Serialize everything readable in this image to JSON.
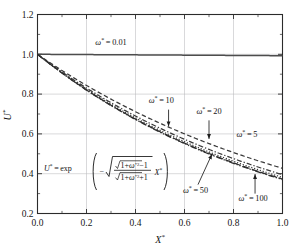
{
  "chart_data": {
    "type": "line",
    "title": "",
    "subtitle": "",
    "xlabel": "X*",
    "ylabel": "U*",
    "xlim": [
      0.0,
      1.0
    ],
    "ylim": [
      0.2,
      1.2
    ],
    "xticks": [
      "0.0",
      "0.2",
      "0.4",
      "0.6",
      "0.8",
      "1.0"
    ],
    "xtick_values": [
      0.0,
      0.2,
      0.4,
      0.6,
      0.8,
      1.0
    ],
    "yticks": [
      "0.2",
      "0.4",
      "0.6",
      "0.8",
      "1.0",
      "1.2"
    ],
    "ytick_values": [
      0.2,
      0.4,
      0.6,
      0.8,
      1.0,
      1.2
    ],
    "grid": true,
    "grid_axes": "both",
    "legend_position": "inline-annotations",
    "minor_ticks": true,
    "equation_annotation": "U* = exp( - sqrt( ( sqrt(1+w*^2) - 1 ) / ( sqrt(1+w*^2) + 1 ) ) X* )",
    "equation_parts": {
      "lhs": "U",
      "lhs_star": "*",
      "eq": "=",
      "exp": "exp",
      "minus": "−",
      "num_radical": "1+ω",
      "num_sup": "*2",
      "num_tail": "−1",
      "den_radical": "1+ω",
      "den_sup": "*2",
      "den_tail": "+1",
      "var": "X",
      "var_star": "*"
    },
    "series": [
      {
        "name": "ω* = 0.01",
        "omega": 0.01,
        "decay_k": 0.00707,
        "style": "solid",
        "color": "#4d4d4d",
        "label_text": "ω*=0.01",
        "label_x": 0.3,
        "label_y": 1.045,
        "has_arrow": false,
        "x": [
          0.0,
          0.1,
          0.2,
          0.3,
          0.4,
          0.5,
          0.6,
          0.7,
          0.8,
          0.9,
          1.0
        ],
        "y": [
          1.0,
          0.999,
          0.999,
          0.998,
          0.997,
          0.996,
          0.996,
          0.995,
          0.994,
          0.994,
          0.993
        ]
      },
      {
        "name": "ω* = 5",
        "omega": 5,
        "decay_k": 0.8507,
        "style": "dashed",
        "color": "#3a3a3a",
        "label_text": "ω*=5",
        "label_x": 0.855,
        "label_y": 0.585,
        "has_arrow": false,
        "x": [
          0.0,
          0.1,
          0.2,
          0.3,
          0.4,
          0.5,
          0.6,
          0.7,
          0.8,
          0.9,
          1.0
        ],
        "y": [
          1.0,
          0.918,
          0.843,
          0.775,
          0.711,
          0.653,
          0.6,
          0.551,
          0.506,
          0.465,
          0.427
        ]
      },
      {
        "name": "ω* = 10",
        "omega": 10,
        "decay_k": 0.9285,
        "style": "dash-dot",
        "color": "#3a3a3a",
        "label_text": "ω*=10",
        "label_x": 0.505,
        "label_y": 0.755,
        "has_arrow": true,
        "arrow_from_x": 0.535,
        "arrow_from_y": 0.722,
        "arrow_to_x": 0.535,
        "arrow_to_y": 0.638,
        "x": [
          0.0,
          0.1,
          0.2,
          0.3,
          0.4,
          0.5,
          0.6,
          0.7,
          0.8,
          0.9,
          1.0
        ],
        "y": [
          1.0,
          0.911,
          0.83,
          0.757,
          0.69,
          0.629,
          0.573,
          0.522,
          0.476,
          0.434,
          0.395
        ]
      },
      {
        "name": "ω* = 20",
        "omega": 20,
        "decay_k": 0.9636,
        "style": "dotted",
        "color": "#3a3a3a",
        "label_text": "ω*=20",
        "label_x": 0.7,
        "label_y": 0.7,
        "has_arrow": true,
        "arrow_from_x": 0.7,
        "arrow_from_y": 0.668,
        "arrow_to_x": 0.7,
        "arrow_to_y": 0.575,
        "x": [
          0.0,
          0.1,
          0.2,
          0.3,
          0.4,
          0.5,
          0.6,
          0.7,
          0.8,
          0.9,
          1.0
        ],
        "y": [
          1.0,
          0.908,
          0.825,
          0.749,
          0.681,
          0.618,
          0.562,
          0.51,
          0.463,
          0.421,
          0.382
        ]
      },
      {
        "name": "ω* = 50",
        "omega": 50,
        "decay_k": 0.9854,
        "style": "long-dash",
        "color": "#2e2e2e",
        "label_text": "ω*=50",
        "label_x": 0.645,
        "label_y": 0.305,
        "has_arrow": true,
        "arrow_from_x": 0.655,
        "arrow_from_y": 0.345,
        "arrow_to_x": 0.712,
        "arrow_to_y": 0.498,
        "x": [
          0.0,
          0.1,
          0.2,
          0.3,
          0.4,
          0.5,
          0.6,
          0.7,
          0.8,
          0.9,
          1.0
        ],
        "y": [
          1.0,
          0.906,
          0.821,
          0.744,
          0.674,
          0.611,
          0.554,
          0.502,
          0.455,
          0.412,
          0.373
        ]
      },
      {
        "name": "ω* = 100",
        "omega": 100,
        "decay_k": 0.9927,
        "style": "dash-dot-dot",
        "color": "#2e2e2e",
        "label_text": "ω*=100",
        "label_x": 0.88,
        "label_y": 0.262,
        "has_arrow": true,
        "arrow_from_x": 0.888,
        "arrow_from_y": 0.3,
        "arrow_to_x": 0.888,
        "arrow_to_y": 0.398,
        "x": [
          0.0,
          0.1,
          0.2,
          0.3,
          0.4,
          0.5,
          0.6,
          0.7,
          0.8,
          0.9,
          1.0
        ],
        "y": [
          1.0,
          0.906,
          0.82,
          0.743,
          0.673,
          0.609,
          0.552,
          0.5,
          0.453,
          0.41,
          0.371
        ]
      }
    ]
  }
}
